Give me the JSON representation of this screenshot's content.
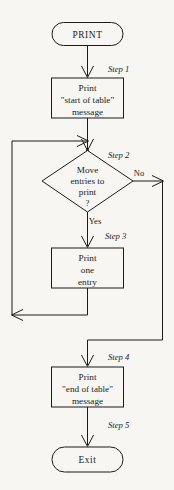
{
  "diagram": {
    "type": "flowchart",
    "background_color": "#f7f6f2",
    "line_color": "#1b1b1b",
    "nodes": [
      {
        "id": "start",
        "shape": "terminator",
        "label": "PRINT",
        "step": ""
      },
      {
        "id": "step1",
        "shape": "process",
        "line1": "Print",
        "line2": "\"start of table\"",
        "line3": "message",
        "step": "Step 1"
      },
      {
        "id": "step2",
        "shape": "decision",
        "line1": "Move",
        "line2": "entries to",
        "line3": "print",
        "line4": "?",
        "step": "Step 2"
      },
      {
        "id": "step3",
        "shape": "process",
        "line1": "Print",
        "line2": "one",
        "line3": "entry",
        "step": "Step 3"
      },
      {
        "id": "step4",
        "shape": "process",
        "line1": "Print",
        "line2": "\"end of table\"",
        "line3": "message",
        "step": "Step 4"
      },
      {
        "id": "end",
        "shape": "terminator",
        "label": "Exit",
        "step": "Step 5"
      }
    ],
    "branch_labels": {
      "yes": "Yes",
      "no": "No"
    }
  }
}
